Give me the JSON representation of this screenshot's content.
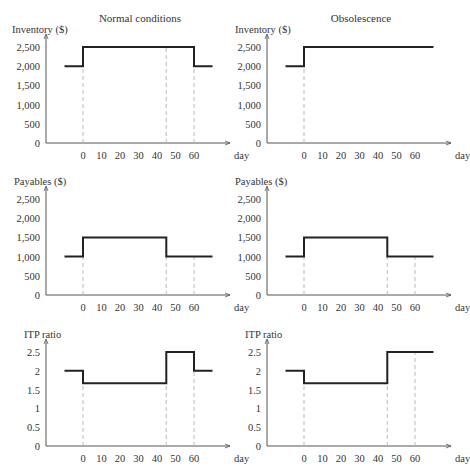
{
  "titles": {
    "left": "Normal conditions",
    "right": "Obsolescence"
  },
  "x_label": "day",
  "x_ticks": [
    0,
    10,
    20,
    30,
    40,
    50,
    60
  ],
  "chart_data": [
    {
      "type": "line",
      "title": "Normal conditions",
      "ylabel": "Inventory ($)",
      "xlabel": "day",
      "ylim": [
        0,
        2500
      ],
      "yticks": [
        "0",
        "500",
        "1,000",
        "1,500",
        "2,000",
        "2,500"
      ],
      "yvals": [
        0,
        500,
        1000,
        1500,
        2000,
        2500
      ],
      "dashed_x": [
        0,
        45,
        60
      ],
      "series": [
        {
          "name": "Inventory",
          "x": [
            -10,
            0,
            0,
            60,
            60,
            70
          ],
          "y": [
            2000,
            2000,
            2500,
            2500,
            2000,
            2000
          ]
        }
      ]
    },
    {
      "type": "line",
      "title": "Obsolescence",
      "ylabel": "Inventory ($)",
      "xlabel": "day",
      "ylim": [
        0,
        2500
      ],
      "yticks": [
        "0",
        "500",
        "1,000",
        "1,500",
        "2,000",
        "2,500"
      ],
      "yvals": [
        0,
        500,
        1000,
        1500,
        2000,
        2500
      ],
      "dashed_x": [
        0
      ],
      "series": [
        {
          "name": "Inventory",
          "x": [
            -10,
            0,
            0,
            70
          ],
          "y": [
            2000,
            2000,
            2500,
            2500
          ]
        }
      ]
    },
    {
      "type": "line",
      "title": "",
      "ylabel": "Payables ($)",
      "xlabel": "day",
      "ylim": [
        0,
        2500
      ],
      "yticks": [
        "0",
        "500",
        "1,000",
        "1,500",
        "2,000",
        "2,500"
      ],
      "yvals": [
        0,
        500,
        1000,
        1500,
        2000,
        2500
      ],
      "dashed_x": [
        0,
        45,
        60
      ],
      "series": [
        {
          "name": "Payables",
          "x": [
            -10,
            0,
            0,
            45,
            45,
            70
          ],
          "y": [
            1000,
            1000,
            1500,
            1500,
            1000,
            1000
          ]
        }
      ]
    },
    {
      "type": "line",
      "title": "",
      "ylabel": "Payables ($)",
      "xlabel": "day",
      "ylim": [
        0,
        2500
      ],
      "yticks": [
        "0",
        "500",
        "1,000",
        "1,500",
        "2,000",
        "2,500"
      ],
      "yvals": [
        0,
        500,
        1000,
        1500,
        2000,
        2500
      ],
      "dashed_x": [
        0,
        45,
        60
      ],
      "series": [
        {
          "name": "Payables",
          "x": [
            -10,
            0,
            0,
            45,
            45,
            70
          ],
          "y": [
            1000,
            1000,
            1500,
            1500,
            1000,
            1000
          ]
        }
      ]
    },
    {
      "type": "line",
      "title": "",
      "ylabel": "ITP ratio",
      "xlabel": "day",
      "ylim": [
        0,
        2.5
      ],
      "yticks": [
        "0",
        "0.5",
        "1",
        "1.5",
        "2",
        "2.5"
      ],
      "yvals": [
        0,
        0.5,
        1,
        1.5,
        2,
        2.5
      ],
      "dashed_x": [
        0,
        45,
        60
      ],
      "series": [
        {
          "name": "ITP ratio",
          "x": [
            -10,
            0,
            0,
            45,
            45,
            60,
            60,
            70
          ],
          "y": [
            2,
            2,
            1.67,
            1.67,
            2.5,
            2.5,
            2,
            2
          ]
        }
      ]
    },
    {
      "type": "line",
      "title": "",
      "ylabel": "ITP ratio",
      "xlabel": "day",
      "ylim": [
        0,
        2.5
      ],
      "yticks": [
        "0",
        "0.5",
        "1",
        "1.5",
        "2",
        "2.5"
      ],
      "yvals": [
        0,
        0.5,
        1,
        1.5,
        2,
        2.5
      ],
      "dashed_x": [
        0,
        45,
        60
      ],
      "series": [
        {
          "name": "ITP ratio",
          "x": [
            -10,
            0,
            0,
            45,
            45,
            70
          ],
          "y": [
            2,
            2,
            1.67,
            1.67,
            2.5,
            2.5
          ]
        }
      ]
    }
  ]
}
